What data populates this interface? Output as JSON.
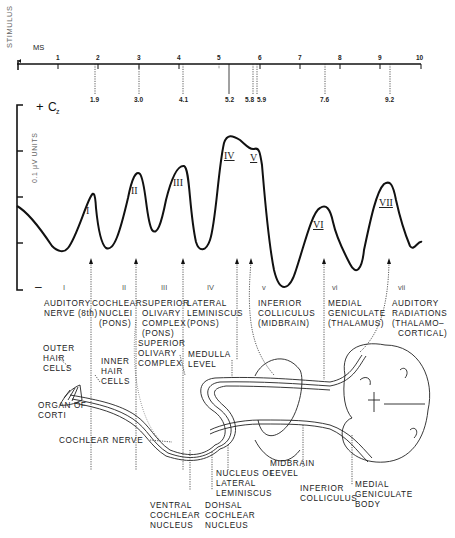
{
  "stimulus_label": "STIMULUS",
  "time_axis": {
    "unit_label": "MS",
    "ticks": [
      "1",
      "2",
      "3",
      "4",
      "5",
      "6",
      "7",
      "8",
      "9",
      "10"
    ],
    "latencies": [
      "1.9",
      "3.0",
      "4.1",
      "5.2",
      "5.8",
      "5.9",
      "7.6",
      "9.2"
    ]
  },
  "amplitude_axis": {
    "polarity_label": "+ Cz",
    "polarity_plus": "+",
    "polarity_C": "C",
    "polarity_sub": "z",
    "units_label": "0.1 μV UNITS",
    "minus_label": "–"
  },
  "peaks": [
    "I",
    "II",
    "III",
    "IV",
    "V",
    "VI",
    "VII"
  ],
  "waves": [
    {
      "numeral": "I",
      "line1": "AUDITORY",
      "line2": "NERVE (8th)",
      "line3": "",
      "line4": ""
    },
    {
      "numeral": "II",
      "line1": "COCHLEAR",
      "line2": "NUCLEI",
      "line3": "(PONS)",
      "line4": ""
    },
    {
      "numeral": "III",
      "line1": "SUPERIOR",
      "line2": "OLIVARY",
      "line3": "COMPLEX",
      "line4": "(PONS)"
    },
    {
      "numeral": "IV",
      "line1": "LATERAL",
      "line2": "LEMINISCUS",
      "line3": "(PONS)",
      "line4": ""
    },
    {
      "numeral": "v",
      "line1": "INFERIOR",
      "line2": "COLLICULUS",
      "line3": "(MIDBRAIN)",
      "line4": ""
    },
    {
      "numeral": "vi",
      "line1": "MEDIAL",
      "line2": "GENICULATE",
      "line3": "(THALAMUS)",
      "line4": ""
    },
    {
      "numeral": "vii",
      "line1": "AUDITORY",
      "line2": "RADIATIONS",
      "line3": "(THALAMO–",
      "line4": "CORTICAL)"
    }
  ],
  "anatomy_labels": {
    "outer_hair_cells": [
      "OUTER",
      "HAIR",
      "CELLS"
    ],
    "inner_hair_cells": [
      "INNER",
      "HAIR",
      "CELLS"
    ],
    "organ_of_corti": [
      "ORGAN OF",
      "CORTI"
    ],
    "superior_olivary_complex": [
      "SUPERIOR",
      "OLIVARY",
      "COMPLEX"
    ],
    "medulla_level": [
      "MEDULLA",
      "LEVEL"
    ],
    "cochlear_nerve": [
      "COCHLEAR NERVE"
    ],
    "ventral_cochlear_nucleus": [
      "VENTRAL",
      "COCHLEAR",
      "NUCLEUS"
    ],
    "dorsal_cochlear_nucleus": [
      "DOHSAL",
      "COCHLEAR",
      "NUCLEUS"
    ],
    "nucleus_lateral_leminiscus": [
      "NUCLEUS OF",
      "LATERAL",
      "LEMINISCUS"
    ],
    "midbrain_level": [
      "MIDBRAIN",
      "LEVEL"
    ],
    "inferior_colliculus": [
      "INFERIOR",
      "COLLICULUS"
    ],
    "medial_geniculate_body": [
      "MEDIAL",
      "GENICULATE",
      "BODY"
    ]
  }
}
